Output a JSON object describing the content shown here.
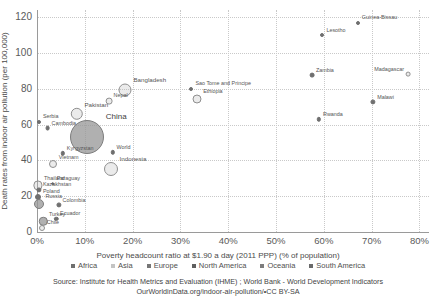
{
  "chart_data": {
    "type": "scatter",
    "title": "",
    "xlabel": "Poverty headcount ratio at $1.90 a day (2011 PPP) (% of population)",
    "ylabel": "Death rates from indoor air pollution (per 100,000)",
    "xlim": [
      0,
      82
    ],
    "ylim": [
      0,
      124
    ],
    "xticks": [
      "0%",
      "10%",
      "20%",
      "30%",
      "40%",
      "50%",
      "60%",
      "70%",
      "80%"
    ],
    "xtick_values": [
      0,
      10,
      20,
      30,
      40,
      50,
      60,
      70,
      80
    ],
    "yticks": [
      "0",
      "20",
      "40",
      "60",
      "80",
      "100",
      "120"
    ],
    "ytick_values": [
      0,
      20,
      40,
      60,
      80,
      100,
      120
    ],
    "grid": true,
    "legend_position": "bottom",
    "bubble_encoding": "population",
    "points": [
      {
        "label": "Guinea-Bissau",
        "x": 67.1,
        "y": 117.0,
        "r": 2.0,
        "style": "tiny",
        "side": "left"
      },
      {
        "label": "Lesotho",
        "x": 59.7,
        "y": 110.0,
        "r": 2.0,
        "style": "tiny",
        "side": "left"
      },
      {
        "label": "Madagascar",
        "x": 77.6,
        "y": 88.0,
        "r": 2.4,
        "style": "open",
        "side": "right"
      },
      {
        "label": "Zambia",
        "x": 57.5,
        "y": 87.5,
        "r": 2.4,
        "style": "tiny",
        "side": "left"
      },
      {
        "label": "Bangladesh",
        "x": 18.5,
        "y": 79.5,
        "r": 6.5,
        "style": "open",
        "side": "left"
      },
      {
        "label": "Sao Tome and Principe",
        "x": 32.3,
        "y": 80.0,
        "r": 2.0,
        "style": "tiny",
        "side": "left"
      },
      {
        "label": "Malawi",
        "x": 70.3,
        "y": 72.5,
        "r": 2.6,
        "style": "tiny",
        "side": "left"
      },
      {
        "label": "Ethiopia",
        "x": 33.5,
        "y": 74.5,
        "r": 4.5,
        "style": "open",
        "side": "left"
      },
      {
        "label": "Nepal",
        "x": 15.0,
        "y": 73.0,
        "r": 3.4,
        "style": "open",
        "side": "left"
      },
      {
        "label": "Pakistan",
        "x": 8.3,
        "y": 66.0,
        "r": 6.2,
        "style": "open",
        "side": "left"
      },
      {
        "label": "Rwanda",
        "x": 59.0,
        "y": 63.0,
        "r": 2.2,
        "style": "tiny",
        "side": "left"
      },
      {
        "label": "Serbia",
        "x": 0.4,
        "y": 61.5,
        "r": 2.0,
        "style": "tiny",
        "side": "left"
      },
      {
        "label": "Cambodia",
        "x": 2.2,
        "y": 58.0,
        "r": 2.4,
        "style": "tiny",
        "side": "left"
      },
      {
        "label": "China",
        "x": 10.5,
        "y": 53.0,
        "r": 17.0,
        "style": "solid",
        "side": "left"
      },
      {
        "label": "Kyrgyzstan",
        "x": 5.4,
        "y": 44.0,
        "r": 2.2,
        "style": "tiny",
        "side": "left"
      },
      {
        "label": "World",
        "x": 15.8,
        "y": 44.5,
        "r": 2.2,
        "style": "tiny",
        "side": "left"
      },
      {
        "label": "Vietnam",
        "x": 3.4,
        "y": 38.0,
        "r": 4.0,
        "style": "open",
        "side": "left"
      },
      {
        "label": "Indonesia",
        "x": 15.5,
        "y": 35.0,
        "r": 7.0,
        "style": "open",
        "side": "left"
      },
      {
        "label": "Paraguay",
        "x": 3.3,
        "y": 27.0,
        "r": 1.8,
        "style": "tiny",
        "side": "left"
      },
      {
        "label": "Thailand",
        "x": 0.2,
        "y": 26.0,
        "r": 4.6,
        "style": "open",
        "side": "left"
      },
      {
        "label": "Kazakhstan",
        "x": 0.4,
        "y": 23.5,
        "r": 2.6,
        "style": "tiny",
        "side": "left"
      },
      {
        "label": "Poland",
        "x": 0.3,
        "y": 19.5,
        "r": 3.0,
        "style": "tiny",
        "side": "left"
      },
      {
        "label": "Russia",
        "x": 0.4,
        "y": 15.5,
        "r": 5.0,
        "style": "solid",
        "side": "left"
      },
      {
        "label": "Colombia",
        "x": 4.5,
        "y": 15.0,
        "r": 2.6,
        "style": "tiny",
        "side": "left"
      },
      {
        "label": "Turkey",
        "x": 1.3,
        "y": 6.0,
        "r": 4.2,
        "style": "solid",
        "side": "left"
      },
      {
        "label": "Ecuador",
        "x": 4.0,
        "y": 7.5,
        "r": 2.2,
        "style": "tiny",
        "side": "left"
      },
      {
        "label": "Chile",
        "x": 1.1,
        "y": 2.0,
        "r": 3.0,
        "style": "open",
        "side": "left"
      }
    ],
    "legend": [
      {
        "label": "Africa",
        "color": "#6f6f6f"
      },
      {
        "label": "Asia",
        "color": "#c4c4c4"
      },
      {
        "label": "Europe",
        "color": "#767676"
      },
      {
        "label": "North America",
        "color": "#5f5f5f"
      },
      {
        "label": "Oceania",
        "color": "#7d7d7d"
      },
      {
        "label": "South America",
        "color": "#6a6a6a"
      }
    ]
  },
  "footer": {
    "source": "Source: Institute for Health Metrics and Evaluation (IHME) ; World Bank - World Development Indicators",
    "attribution": "OurWorldinData.org/indoor-air-pollution/•CC BY-SA"
  }
}
